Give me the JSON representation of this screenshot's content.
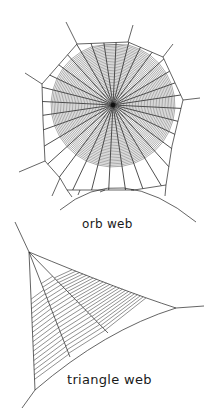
{
  "figure": {
    "orb_web": {
      "label": "orb web",
      "center": [
        113,
        105
      ],
      "radii_count": 32,
      "spiral_inner_r": 6,
      "spiral_outer_r": 62,
      "spiral_turns": 38,
      "frame": [
        [
          42,
          84
        ],
        [
          77,
          44
        ],
        [
          128,
          42
        ],
        [
          163,
          57
        ],
        [
          183,
          100
        ],
        [
          172,
          146
        ],
        [
          166,
          185
        ],
        [
          134,
          190
        ],
        [
          105,
          190
        ],
        [
          80,
          190
        ],
        [
          67,
          190
        ],
        [
          60,
          178
        ],
        [
          45,
          161
        ],
        [
          43,
          120
        ]
      ],
      "anchors": [
        [
          [
            42,
            84
          ],
          [
            25,
            73
          ]
        ],
        [
          [
            77,
            44
          ],
          [
            66,
            22
          ]
        ],
        [
          [
            128,
            42
          ],
          [
            133,
            25
          ]
        ],
        [
          [
            163,
            57
          ],
          [
            173,
            44
          ]
        ],
        [
          [
            183,
            100
          ],
          [
            200,
            98
          ]
        ],
        [
          [
            45,
            161
          ],
          [
            19,
            172
          ]
        ]
      ],
      "ground_arc": {
        "from": [
          60,
          210
        ],
        "ctrl": [
          120,
          160
        ],
        "to": [
          196,
          222
        ]
      },
      "stroke_color": "#222222"
    },
    "triangle_web": {
      "label": "triangle web",
      "apex": [
        29,
        252
      ],
      "right": [
        176,
        308
      ],
      "bottom": [
        35,
        390
      ],
      "stroke_color": "#222222"
    }
  }
}
